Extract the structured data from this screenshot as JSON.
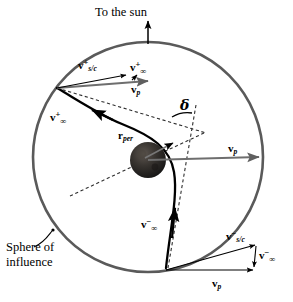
{
  "figure": {
    "title_annotation": "To the sun",
    "sphere_label": "Sphere of\ninfluence",
    "periapsis_label_base": "r",
    "periapsis_label_sub": "per",
    "deflection_symbol": "δ",
    "colors": {
      "sphere_stroke": "#5a5a5a",
      "planet_fill": "#2b2b2b",
      "trajectory": "#000000",
      "vector_arrow": "#000000",
      "velocity_gray": "#6e6e6e",
      "dashed_asymptote": "#333333",
      "background": "#ffffff"
    },
    "geometry": {
      "sphere_center_x": 148,
      "sphere_center_y": 157,
      "sphere_radius": 115,
      "planet_center_x": 148,
      "planet_center_y": 160,
      "planet_radius": 18
    },
    "vectors": [
      {
        "id": "v-sc-plus",
        "base": "v",
        "sub": "s/c",
        "sup": "+",
        "inf": "",
        "role": "spacecraft-heliocentric-outgoing",
        "x": 78,
        "y": 60
      },
      {
        "id": "v-inf-plus-top",
        "base": "v",
        "sub": "",
        "sup": "+",
        "inf": "∞",
        "role": "hyperbolic-excess-outgoing-triangle",
        "x": 130,
        "y": 67
      },
      {
        "id": "v-p-top",
        "base": "v",
        "sub": "p",
        "sup": "",
        "inf": "",
        "role": "planet-velocity-top",
        "x": 131,
        "y": 84
      },
      {
        "id": "v-inf-plus-traj",
        "base": "v",
        "sub": "",
        "sup": "+",
        "inf": "∞",
        "role": "hyperbolic-excess-outgoing-trajectory",
        "x": 50,
        "y": 113
      },
      {
        "id": "v-p-middle",
        "base": "v",
        "sub": "p",
        "sup": "",
        "inf": "",
        "role": "planet-velocity-middle",
        "x": 228,
        "y": 148
      },
      {
        "id": "v-inf-minus-traj",
        "base": "v",
        "sub": "",
        "sup": "−",
        "inf": "∞",
        "role": "hyperbolic-excess-incoming-trajectory",
        "x": 143,
        "y": 221
      },
      {
        "id": "v-sc-minus",
        "base": "v",
        "sub": "s/c",
        "sup": "−",
        "inf": "",
        "role": "spacecraft-heliocentric-incoming",
        "x": 227,
        "y": 233
      },
      {
        "id": "v-inf-minus-tri",
        "base": "v",
        "sub": "",
        "sup": "−",
        "inf": "∞",
        "role": "hyperbolic-excess-incoming-triangle",
        "x": 252,
        "y": 252
      },
      {
        "id": "v-p-bottom",
        "base": "v",
        "sub": "p",
        "sup": "",
        "inf": "",
        "role": "planet-velocity-bottom",
        "x": 230,
        "y": 281
      }
    ]
  }
}
